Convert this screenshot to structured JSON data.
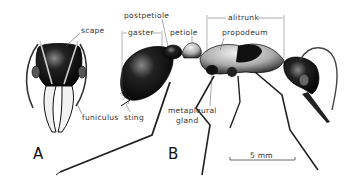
{
  "figure": {
    "panels": [
      {
        "id": "A",
        "label": "A",
        "subject": "ant head, frontal view"
      },
      {
        "id": "B",
        "label": "B",
        "subject": "worker ant, lateral view"
      }
    ],
    "labels": {
      "scape": "scape",
      "funiculus": "funiculus",
      "postpetiole": "postpetiole",
      "gaster": "gaster",
      "petiole": "petiole",
      "alitrunk": "alitrunk",
      "propodeum": "propodeum",
      "sting": "sting",
      "metapleural_line1": "metapleural",
      "metapleural_line2": "gland"
    },
    "scale_bar": {
      "label": "5 mm"
    },
    "colors": {
      "ink": "#111111",
      "label": "#333333",
      "background": "#ffffff"
    }
  }
}
